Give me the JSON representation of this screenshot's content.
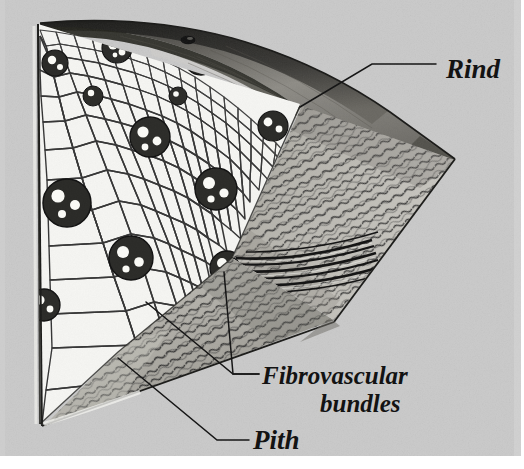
{
  "figure": {
    "kind": "botanical-illustration",
    "background_color": "#c9c9c9",
    "page_color": "#ffffff",
    "ink_color": "#111111",
    "paper_texture": true
  },
  "labels": [
    {
      "id": "rind",
      "name": "label-rind",
      "text": "Rind",
      "x": 446,
      "y": 72,
      "font_size": 26,
      "anchor": "start",
      "leader": [
        [
          435,
          64
        ],
        [
          370,
          64
        ],
        [
          300,
          106
        ]
      ]
    },
    {
      "id": "fibrovascular",
      "name": "label-fibrovascular-bundles",
      "text": "Fibrovascular",
      "text_line2": "bundles",
      "x": 262,
      "y": 382,
      "x2": 318,
      "y2": 410,
      "font_size": 25,
      "anchor": "start",
      "leaders": [
        [
          [
            258,
            374
          ],
          [
            232,
            374
          ],
          [
            222,
            268
          ]
        ],
        [
          [
            258,
            374
          ],
          [
            232,
            374
          ],
          [
            144,
            300
          ]
        ]
      ]
    },
    {
      "id": "pith",
      "name": "label-pith",
      "text": "Pith",
      "x": 252,
      "y": 447,
      "font_size": 26,
      "anchor": "start",
      "leader": [
        [
          248,
          439
        ],
        [
          216,
          439
        ],
        [
          118,
          358
        ]
      ]
    }
  ],
  "anatomy": {
    "rind": {
      "name": "rind-region",
      "description": "dark outer shell at top and right of the wedge",
      "fill_dark": "#3a3a38",
      "fill_shade": "#8d8b86"
    },
    "pith": {
      "name": "pith-region",
      "description": "pale parenchyma tissue with polygonal cells filling the cut face",
      "fill": "#f4f4f1",
      "cell_line": "#1d1d1d"
    },
    "longitudinal_face": {
      "name": "longitudinal-cut-face",
      "description": "lower-right hatched face showing elongated fibre cells",
      "fill": "#b4b2ac",
      "hatch": "#333333"
    },
    "bundles": {
      "name": "fibrovascular-bundle",
      "count": 13,
      "ring_color": "#262626",
      "vessel_color": "#fbfbf8",
      "positions": [
        {
          "cx": 55,
          "cy": 63,
          "r": 13
        },
        {
          "cx": 117,
          "cy": 48,
          "r": 15
        },
        {
          "cx": 201,
          "cy": 58,
          "r": 17
        },
        {
          "cx": 273,
          "cy": 126,
          "r": 15
        },
        {
          "cx": 150,
          "cy": 137,
          "r": 20
        },
        {
          "cx": 216,
          "cy": 189,
          "r": 21
        },
        {
          "cx": 67,
          "cy": 203,
          "r": 24
        },
        {
          "cx": 131,
          "cy": 258,
          "r": 22
        },
        {
          "cx": 44,
          "cy": 305,
          "r": 16
        },
        {
          "cx": 227,
          "cy": 268,
          "r": 16
        },
        {
          "cx": 93,
          "cy": 96,
          "r": 10
        },
        {
          "cx": 248,
          "cy": 43,
          "r": 11
        },
        {
          "cx": 178,
          "cy": 96,
          "r": 9
        }
      ]
    },
    "rind_pore": {
      "name": "rind-pore",
      "cx": 188,
      "cy": 40,
      "rx": 7,
      "ry": 4,
      "fill": "#141414"
    },
    "bundle_strand": {
      "name": "longitudinal-bundle-strand",
      "description": "horizontal fibre strand running right from the cut-edge bundle"
    }
  }
}
